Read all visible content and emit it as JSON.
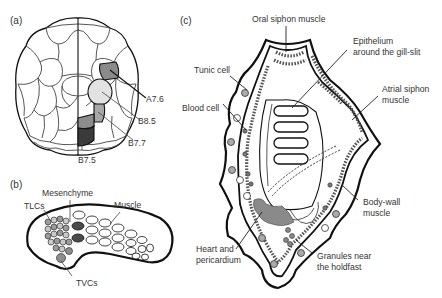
{
  "figure": {
    "panels": [
      {
        "id": "a",
        "label": "(a)",
        "description": "Ascidian embryo cell lineage (vegetal view)",
        "labels": {
          "a76": "A7.6",
          "b85": "B8.5",
          "b77": "B7.7",
          "b75": "B7.5"
        }
      },
      {
        "id": "b",
        "label": "(b)",
        "description": "Larva with mesodermal tissues",
        "labels": {
          "tlcs": "TLCs",
          "mesenchyme": "Mesenchyme",
          "muscle": "Muscle",
          "tvcs": "TVCs"
        }
      },
      {
        "id": "c",
        "label": "(c)",
        "description": "Juvenile/adult body plan",
        "labels": {
          "oral_siphon_muscle": "Oral siphon muscle",
          "epithelium_line1": "Epithelium",
          "epithelium_line2": "around the gill-slit",
          "tunic_cell": "Tunic cell",
          "atrial_line1": "Atrial siphon",
          "atrial_line2": "muscle",
          "blood_cell": "Blood cell",
          "bodywall_line1": "Body-wall",
          "bodywall_line2": "muscle",
          "heart_line1": "Heart and",
          "heart_line2": "pericardium",
          "granules_line1": "Granules near",
          "granules_line2": "the holdfast"
        }
      }
    ],
    "colors": {
      "a76": "#8a8a8a",
      "b85": "#e2e2e2",
      "b77": "#a8a8a8",
      "b75_top": "#8c8c8c",
      "b75_bottom": "#3a3a3a",
      "mesenchyme": "#4a4a4a",
      "tlc": "#9a9a9a",
      "tvc": "#8e8e8e",
      "heart": "#8a8a8a"
    }
  }
}
